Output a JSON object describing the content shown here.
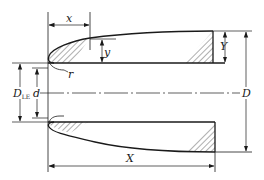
{
  "diagram": {
    "type": "cross-section dimension drawing",
    "labels": {
      "x": "x",
      "y": "y",
      "Y": "Y",
      "r": "r",
      "D_LE_main": "D",
      "D_LE_sub": "LE",
      "d": "d",
      "D": "D",
      "X": "X"
    },
    "colors": {
      "line": "#1a1a1a",
      "background": "#ffffff"
    }
  }
}
